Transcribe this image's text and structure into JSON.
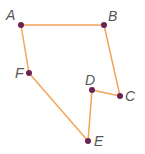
{
  "diagram": {
    "type": "polygon",
    "edge_color": "#f2a55a",
    "point_color": "#6b2450",
    "label_color": "#555555",
    "points": [
      {
        "label": "A",
        "x": 21,
        "y": 25,
        "lx": 6,
        "ly": 20
      },
      {
        "label": "B",
        "x": 104,
        "y": 25,
        "lx": 108,
        "ly": 21
      },
      {
        "label": "C",
        "x": 120,
        "y": 96,
        "lx": 125,
        "ly": 101
      },
      {
        "label": "D",
        "x": 92,
        "y": 90,
        "lx": 85,
        "ly": 85
      },
      {
        "label": "E",
        "x": 88,
        "y": 141,
        "lx": 94,
        "ly": 146
      },
      {
        "label": "F",
        "x": 29,
        "y": 73,
        "lx": 15,
        "ly": 78
      }
    ],
    "edges": [
      [
        "A",
        "B"
      ],
      [
        "B",
        "C"
      ],
      [
        "C",
        "D"
      ],
      [
        "D",
        "E"
      ],
      [
        "E",
        "F"
      ],
      [
        "F",
        "A"
      ]
    ]
  }
}
